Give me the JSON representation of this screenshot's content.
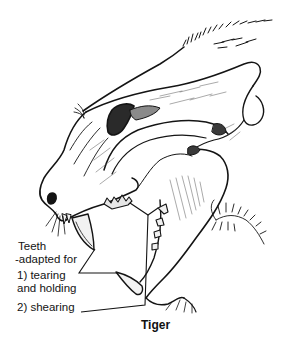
{
  "figure": {
    "caption": "Tiger",
    "labels": {
      "heading_line1": "Teeth",
      "heading_line2": "-adapted for",
      "item1_line1": "1) tearing",
      "item1_line2": "and holding",
      "item2": "2) shearing"
    },
    "colors": {
      "ink": "#141414",
      "background": "#ffffff"
    }
  }
}
